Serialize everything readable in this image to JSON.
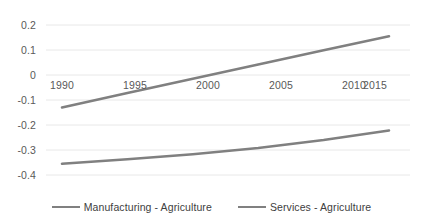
{
  "chart_data": {
    "type": "line",
    "title": "",
    "subtitle": "",
    "xlabel": "",
    "ylabel": "",
    "x": [
      1990,
      1995,
      2000,
      2005,
      2010,
      2015
    ],
    "xlim": [
      1990,
      2015
    ],
    "ylim": [
      -0.4,
      0.2
    ],
    "yticks": [
      0.2,
      0.1,
      0,
      -0.1,
      -0.2,
      -0.3,
      -0.4
    ],
    "ytick_labels": [
      "0.2",
      "0.1",
      "0",
      "-0.1",
      "-0.2",
      "-0.3",
      "-0.4"
    ],
    "xticks": [
      1990,
      1995,
      2000,
      2005,
      2010,
      2015
    ],
    "xtick_labels": [
      "1990",
      "1995",
      "2000",
      "2005",
      "2010",
      "2015"
    ],
    "grid": true,
    "grid_axis": "y",
    "legend_position": "bottom",
    "series": [
      {
        "name": "Manufacturing - Agriculture",
        "color": "#808080",
        "values": [
          -0.13,
          -0.072,
          -0.015,
          0.042,
          0.099,
          0.155
        ]
      },
      {
        "name": "Services - Agriculture",
        "color": "#808080",
        "values": [
          -0.355,
          -0.337,
          -0.317,
          -0.292,
          -0.26,
          -0.222
        ]
      }
    ]
  },
  "axes": {
    "y_labels": [
      "0.2",
      "0.1",
      "0",
      "-0.1",
      "-0.2",
      "-0.3",
      "-0.4"
    ],
    "x_labels": [
      "1990",
      "1995",
      "2000",
      "2005",
      "2010",
      "2015"
    ]
  },
  "legend": {
    "items": [
      {
        "label": "Manufacturing - Agriculture",
        "color": "#808080"
      },
      {
        "label": "Services - Agriculture",
        "color": "#808080"
      }
    ]
  },
  "colors": {
    "series_line": "#808080",
    "gridline": "#e8e8e8",
    "tick_text": "#595959",
    "legend_text": "#404040",
    "background": "#ffffff"
  }
}
